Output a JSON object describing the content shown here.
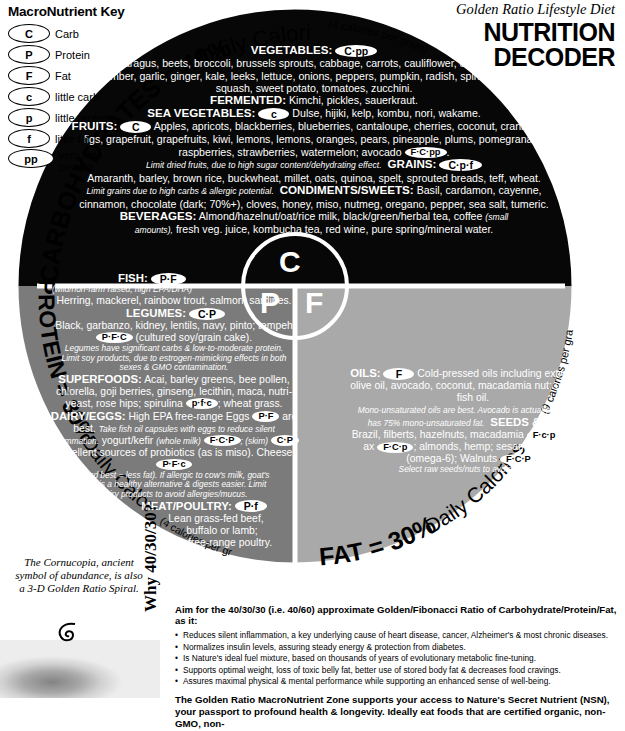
{
  "key": {
    "title": "MacroNutrient Key",
    "items": [
      {
        "badge": "C",
        "label": "Carb"
      },
      {
        "badge": "P",
        "label": "Protein"
      },
      {
        "badge": "F",
        "label": "Fat"
      },
      {
        "badge": "c",
        "label": "little carb"
      },
      {
        "badge": "p",
        "label": "little protein"
      },
      {
        "badge": "f",
        "label": "little fat"
      },
      {
        "badge": "pp",
        "label": "very little protein"
      }
    ]
  },
  "header": {
    "tagline": "Golden Ratio Lifestyle Diet",
    "title_line1": "NUTRITION",
    "title_line2": "DECODER"
  },
  "wheel": {
    "center": {
      "carb": "C",
      "protein": "P",
      "fat": "F"
    },
    "arcs": {
      "carb_main": "CARBOHYDRATES = 40%",
      "carb_sub": "Daily Calories",
      "carb_cal": "(4 calories per gram)",
      "protein_main": "PROTEIN = 30%",
      "protein_sub": "Daily Calories",
      "protein_cal": "(4 calories per gram)",
      "fat_main": "FAT = 30%",
      "fat_sub": "Daily Calories",
      "fat_cal": "(9 calories per gram)"
    },
    "colors": {
      "carb_fill": "#070707",
      "protein_fill": "#7b7b7b",
      "fat_fill": "#a9a9a9",
      "divider": "#ffffff"
    }
  },
  "carb_section": {
    "vegetables_head": "VEGETABLES:",
    "vegetables_badge": "C·pp",
    "vegetables_body": "Asparagus, beets, broccoli, brussels sprouts, cabbage, carrots, cauliflower, celery, chard, cucumber, garlic, ginger, kale, leeks, lettuce, onions, peppers, pumpkin, radish, spinach, sprouts, squash, sweet potato, tomatoes, zucchini.",
    "fermented_head": "FERMENTED:",
    "fermented_body": "Kimchi, pickles, sauerkraut.",
    "sea_head": "SEA VEGETABLES:",
    "sea_badge": "c",
    "sea_body": "Dulse, hijiki, kelp, kombu, nori, wakame.",
    "fruits_head": "FRUITS:",
    "fruits_badge": "C",
    "fruits_body": "Apples, apricots, blackberries, blueberries, cantaloupe, cherries, coconut, cranberries, figs, grapefruit, grapefruits, kiwi, lemons, lemons, oranges, pears, pineapple, plums, pomegranate, raspberries, strawberries, watermelon; avocado",
    "fruits_badge2": "F·C·pp",
    "fruits_note": "Limit dried fruits, due to high sugar content/dehydrating effect.",
    "grains_head": "GRAINS:",
    "grains_badge": "C·p·f",
    "grains_body": "Amaranth, barley, brown rice, buckwheat, millet, oats, quinoa, spelt, sprouted breads, teff, wheat.",
    "grains_note": "Limit grains due to high carbs & allergic potential.",
    "condiments_head": "CONDIMENTS/SWEETS:",
    "condiments_body": "Basil, cardamon, cayenne, cinnamon, chocolate (dark; 70%+), cloves, honey, miso, nutmeg, oregano, pepper, sea salt, tumeric.",
    "beverages_head": "BEVERAGES:",
    "beverages_body1": "Almond/hazelnut/oat/rice milk, black/green/herbal tea, coffee",
    "beverages_note": "(small amounts),",
    "beverages_body2": "fresh veg. juice, kombucha tea, red wine,",
    "beverages_body3": "pure spring/mineral water."
  },
  "protein_section": {
    "fish_head": "FISH:",
    "fish_badge": "P·F",
    "fish_note": "(wild/non-farm raised; high EPA/DHA)",
    "fish_body": "Herring, mackerel, rainbow trout, salmon, sardines.",
    "legumes_head": "LEGUMES:",
    "legumes_badge": "C·P",
    "legumes_body1": "Black, garbanzo, kidney, lentils, navy, pinto; tempeh",
    "legumes_badge2": "P·F·C",
    "legumes_body2": "(cultured soy/grain cake).",
    "legumes_note": "Legumes have significant carbs & low-to-moderate protein. Limit soy products, due to estrogen-mimicking effects in both sexes & GMO contamination.",
    "super_head": "SUPERFOODS:",
    "super_body1": "Acai, barley greens, bee pollen, chlorella, goji berries, ginseng, lecithin, maca, nutri-yeast, rose hips; spirulina",
    "super_badge": "p·f·c",
    "super_body2": "; wheat grass.",
    "dairy_head": "DAIRY/EGGS:",
    "dairy_body1": "High EPA free-range Eggs",
    "dairy_badge1": "P·F",
    "dairy_body2": "are best.",
    "dairy_note1": "Take fish oil capsules with eggs to reduce silent inflammation.",
    "dairy_body3": "yogurt/kefir",
    "dairy_note2": "(whole milk)",
    "dairy_badge2": "F·C·P",
    "dairy_note3": "; (skim)",
    "dairy_badge3": "C·P",
    "dairy_body4": "excellent sources of probiotics (as is miso). Cheese",
    "dairy_badge4": "P·F·c",
    "dairy_note4": "(hard best = less fat). If allergic to cow's milk, goat's milk is a healthy alternative & digests easier. Limit dairy products to avoid allergies/mucus.",
    "meat_head": "MEAT/POULTRY:",
    "meat_badge": "P·f",
    "meat_body1": "Lean grass-fed beef,",
    "meat_body2": "buffalo or lamb;",
    "meat_body3": "free-range poultry."
  },
  "fat_section": {
    "oils_head": "OILS:",
    "oils_badge": "F",
    "oils_body": "Cold-pressed oils including extra-virgin olive oil, avocado, coconut, macadamia nut; omega-3 fish oil.",
    "oils_note": "Mono-unsaturated oils are best. Avocado is actually a fruit, yet has 75% mono-unsaturated fat.",
    "seeds_head": "SEEDS & NUTS:",
    "seeds_body1": "Brazil, filberts, hazelnuts, macadamia",
    "seeds_badge1": "F·c·p",
    "seeds_body2": "; chia,fl ax",
    "seeds_badge2": "F·C·p",
    "seeds_body3": "; almonds, hemp; sesame/ sunflower (omega-6); Walnuts",
    "seeds_badge3": "F·C·P",
    "seeds_body4": ";",
    "seeds_note": "Select raw seeds/nuts to avoid rancidity."
  },
  "cornucopia": {
    "caption": "The Cornucopia, ancient symbol of abundance, is also a 3-D Golden Ratio Spiral."
  },
  "bottom": {
    "why_label": "Why 40/30/30?",
    "lead": "Aim for the 40/30/30 (i.e. 40/60) approximate Golden/Fibonacci Ratio of Carbohydrate/Protein/Fat, as it:",
    "bullets": [
      "Reduces silent inflammation, a key underlying cause of heart disease, cancer, Alzheimer's & most chronic diseases.",
      "Normalizes insulin levels, assuring steady energy & protection from diabetes.",
      "Is Nature's ideal fuel mixture, based on thousands of years of evolutionary metabolic fine-tuning.",
      "Supports optimal weight, loss of toxic belly fat, better use of stored body fat & decreases food cravings.",
      "Assures maximal physical & mental performance while supporting an enhanced sense of well-being."
    ],
    "closing": "The Golden Ratio MacroNutrient Zone supports your access to Nature's Secret Nutrient (NSN), your passport to profound health & longevity. Ideally eat foods that are certified organic, non-GMO, non-"
  }
}
